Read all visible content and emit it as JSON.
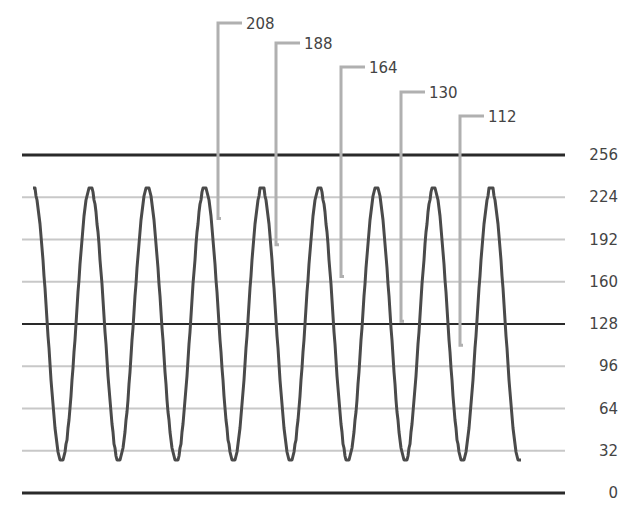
{
  "chart_data": {
    "type": "line",
    "title": "",
    "xlabel": "",
    "ylabel": "",
    "ylim": [
      0,
      256
    ],
    "y_ticks": [
      0,
      32,
      64,
      96,
      128,
      160,
      192,
      224,
      256
    ],
    "y_tick_labels": [
      "0",
      "32",
      "64",
      "96",
      "128",
      "160",
      "192",
      "224",
      "256"
    ],
    "y_axis_position": "right",
    "grid": true,
    "reference_lines": [
      256,
      128,
      0
    ],
    "series": [
      {
        "name": "sampled sine wave",
        "amplitude_max": 232,
        "amplitude_min": 24,
        "center": 128,
        "cycles": 8.5,
        "peaks_x_px": [
          33,
          89,
          146,
          204,
          261,
          319,
          376,
          434,
          491
        ],
        "troughs_x_px": [
          60,
          118,
          174,
          232,
          290,
          348,
          406,
          463,
          521
        ]
      }
    ],
    "annotations": [
      {
        "label": "208",
        "value": 208,
        "line_x": 218,
        "label_y": 27
      },
      {
        "label": "188",
        "value": 188,
        "line_x": 276,
        "label_y": 47
      },
      {
        "label": "164",
        "value": 164,
        "line_x": 341,
        "label_y": 71
      },
      {
        "label": "130",
        "value": 130,
        "line_x": 401,
        "label_y": 96
      },
      {
        "label": "112",
        "value": 112,
        "line_x": 460,
        "label_y": 120
      }
    ],
    "colors": {
      "wave": "#4a4a4a",
      "grid": "#c8c8c8",
      "reference": "#2a2a2a",
      "leader": "#b0b0b0",
      "text": "#444444"
    }
  }
}
